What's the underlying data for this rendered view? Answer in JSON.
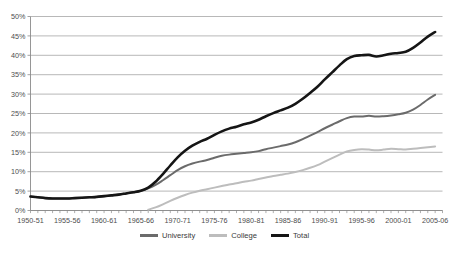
{
  "chart": {
    "title": "",
    "legend_position": "bottom"
  },
  "axes": {
    "y_labels": [
      "50%",
      "45%",
      "40%",
      "35%",
      "30%",
      "25%",
      "20%",
      "15%",
      "10%",
      "5%",
      "0%"
    ],
    "y_values": [
      50,
      45,
      40,
      35,
      30,
      25,
      20,
      15,
      10,
      5,
      0
    ],
    "x_labels": [
      "1950-51",
      "1955-56",
      "1960-61",
      "1965-66",
      "1970-71",
      "1975-76",
      "1980-81",
      "1985-86",
      "1990-91",
      "1995-96",
      "2000-01",
      "2005-06"
    ],
    "x_label_years": [
      1950,
      1955,
      1960,
      1965,
      1970,
      1975,
      1980,
      1985,
      1990,
      1995,
      2000,
      2005
    ]
  },
  "legend": [
    {
      "label": "University",
      "color": "#6b6b6b"
    },
    {
      "label": "College",
      "color": "#bdbdbd"
    },
    {
      "label": "Total",
      "color": "#151515"
    }
  ],
  "colors": {
    "university": "#6b6b6b",
    "college": "#bdbdbd",
    "total": "#151515",
    "gridline": "#9a9a9a",
    "axis": "#8a8a8a",
    "text": "#4d4d4d",
    "background": "#ffffff"
  },
  "chart_data": {
    "type": "line",
    "title": "",
    "xlabel": "",
    "ylabel": "",
    "ylim": [
      0,
      50
    ],
    "xlim": [
      1950,
      2006
    ],
    "grid": true,
    "legend_position": "bottom",
    "x": [
      1950,
      1951,
      1952,
      1953,
      1954,
      1955,
      1956,
      1957,
      1958,
      1959,
      1960,
      1961,
      1962,
      1963,
      1964,
      1965,
      1966,
      1967,
      1968,
      1969,
      1970,
      1971,
      1972,
      1973,
      1974,
      1975,
      1976,
      1977,
      1978,
      1979,
      1980,
      1981,
      1982,
      1983,
      1984,
      1985,
      1986,
      1987,
      1988,
      1989,
      1990,
      1991,
      1992,
      1993,
      1994,
      1995,
      1996,
      1997,
      1998,
      1999,
      2000,
      2001,
      2002,
      2003,
      2004,
      2005
    ],
    "x_tick_labels": [
      "1950-51",
      "1955-56",
      "1960-61",
      "1965-66",
      "1970-71",
      "1975-76",
      "1980-81",
      "1985-86",
      "1990-91",
      "1995-96",
      "2000-01",
      "2005-06"
    ],
    "series": [
      {
        "name": "University",
        "color": "#6b6b6b",
        "values": [
          3.6,
          3.4,
          3.2,
          3.1,
          3.1,
          3.1,
          3.2,
          3.3,
          3.4,
          3.5,
          3.7,
          3.9,
          4.1,
          4.4,
          4.7,
          5.1,
          5.7,
          6.6,
          7.8,
          9.1,
          10.4,
          11.4,
          12.1,
          12.6,
          13.0,
          13.6,
          14.1,
          14.4,
          14.6,
          14.8,
          15.0,
          15.3,
          15.8,
          16.2,
          16.6,
          17.0,
          17.6,
          18.4,
          19.3,
          20.2,
          21.2,
          22.1,
          23.0,
          23.8,
          24.2,
          24.2,
          24.4,
          24.2,
          24.3,
          24.5,
          24.8,
          25.2,
          26.0,
          27.2,
          28.6,
          29.8
        ]
      },
      {
        "name": "College",
        "color": "#bdbdbd",
        "values": [
          0.0,
          0.0,
          0.0,
          0.0,
          0.0,
          0.0,
          0.0,
          0.0,
          0.0,
          0.0,
          0.0,
          0.0,
          0.0,
          0.0,
          0.0,
          0.0,
          0.2,
          0.8,
          1.6,
          2.5,
          3.3,
          4.0,
          4.6,
          5.1,
          5.5,
          5.9,
          6.3,
          6.7,
          7.0,
          7.4,
          7.7,
          8.1,
          8.5,
          8.9,
          9.2,
          9.5,
          9.9,
          10.4,
          11.0,
          11.7,
          12.6,
          13.5,
          14.4,
          15.2,
          15.6,
          15.8,
          15.7,
          15.5,
          15.7,
          15.9,
          15.8,
          15.7,
          15.9,
          16.1,
          16.3,
          16.5
        ]
      },
      {
        "name": "Total",
        "color": "#151515",
        "values": [
          3.6,
          3.4,
          3.2,
          3.1,
          3.1,
          3.1,
          3.2,
          3.3,
          3.4,
          3.5,
          3.7,
          3.9,
          4.1,
          4.4,
          4.7,
          5.1,
          5.9,
          7.4,
          9.4,
          11.6,
          13.7,
          15.4,
          16.7,
          17.7,
          18.5,
          19.5,
          20.4,
          21.1,
          21.6,
          22.2,
          22.7,
          23.4,
          24.3,
          25.1,
          25.8,
          26.5,
          27.5,
          28.8,
          30.3,
          31.9,
          33.8,
          35.6,
          37.4,
          39.0,
          39.8,
          40.0,
          40.1,
          39.7,
          40.0,
          40.4,
          40.6,
          40.9,
          41.9,
          43.3,
          44.8,
          46.0
        ]
      }
    ]
  }
}
